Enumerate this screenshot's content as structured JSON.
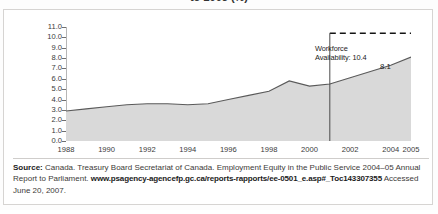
{
  "figure": {
    "title_sliver": "to 2005 (%)"
  },
  "chart_data": {
    "type": "area",
    "title": "",
    "xlabel": "",
    "ylabel": "",
    "x": [
      1988,
      1989,
      1990,
      1991,
      1992,
      1993,
      1994,
      1995,
      1996,
      1997,
      1998,
      1999,
      2000,
      2001,
      2002,
      2003,
      2004,
      2005
    ],
    "values": [
      2.9,
      3.1,
      3.3,
      3.5,
      3.6,
      3.6,
      3.5,
      3.6,
      4.0,
      4.4,
      4.8,
      5.8,
      5.3,
      5.5,
      6.1,
      6.7,
      7.3,
      8.1
    ],
    "ylim": [
      0.0,
      11.0
    ],
    "ytick_step": 1.0,
    "ytick_labels": [
      "11.0",
      "10.0",
      "9.0",
      "8.0",
      "7.0",
      "6.0",
      "5.0",
      "4.0",
      "3.0",
      "2.0",
      "1.0",
      "0.0"
    ],
    "xtick_labels": [
      "1988",
      "1990",
      "1992",
      "1994",
      "1996",
      "1998",
      "2000",
      "2002",
      "2004",
      "2005"
    ],
    "xtick_values": [
      1988,
      1990,
      1992,
      1994,
      1996,
      1998,
      2000,
      2002,
      2004,
      2005
    ],
    "xlim": [
      1988,
      2005
    ],
    "grid": false,
    "legend": "none",
    "series_fill": "#d9d9d9",
    "series_stroke": "#5a5a5a",
    "annotations": [
      {
        "name": "workforce-availability-line",
        "type": "hline",
        "value": 10.4,
        "style": "dashed",
        "label_line1": "Workforce",
        "label_line2": "Availability: 10.4",
        "color": "#1b1b1b"
      },
      {
        "name": "year-marker-2001",
        "type": "vline",
        "value": 2001,
        "style": "solid",
        "color": "#4a4a4a"
      },
      {
        "name": "endpoint-value",
        "type": "point-label",
        "x": 2005,
        "y": 8.1,
        "text": "8.1"
      }
    ]
  },
  "source": {
    "lead": "Source:",
    "text_before_url": " Canada. Treasury Board Secretariat of Canada. Employment Equity in the Public Service 2004–05 Annual Report to Parliament. ",
    "url": "www.psagency-agencefp.gc.ca/reports-rapports/ee-0501_e.asp#_Toc143307355",
    "text_after_url": " Accessed June 20, 2007."
  }
}
